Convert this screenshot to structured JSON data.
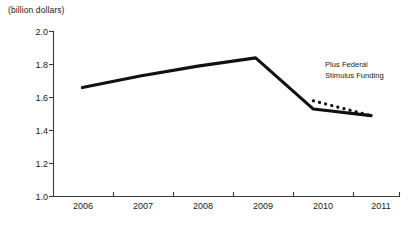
{
  "chart_data": {
    "type": "line",
    "title": "",
    "subtitle": "",
    "unit_label": "(billion dollars)",
    "xlabel": "",
    "ylabel": "",
    "categories": [
      "2006",
      "2007",
      "2008",
      "2009",
      "2010",
      "2011"
    ],
    "x": [
      2006,
      2007,
      2008,
      2009,
      2010,
      2011
    ],
    "xlim": [
      2005.5,
      2011.5
    ],
    "ylim": [
      1.0,
      2.0
    ],
    "yticks": [
      "1.0",
      "1.2",
      "1.4",
      "1.6",
      "1.8",
      "2.0"
    ],
    "ytick_values": [
      1.0,
      1.2,
      1.4,
      1.6,
      1.8,
      2.0
    ],
    "grid": false,
    "legend": "none",
    "series": [
      {
        "name": "Base funding",
        "style": "solid",
        "color": "#111111",
        "x": [
          2006,
          2007,
          2008,
          2009,
          2010,
          2011
        ],
        "values": [
          1.66,
          1.73,
          1.79,
          1.84,
          1.53,
          1.49
        ]
      },
      {
        "name": "Plus Federal Stimulus Funding",
        "style": "dotted",
        "color": "#111111",
        "x": [
          2010,
          2011
        ],
        "values": [
          1.58,
          1.49
        ]
      }
    ],
    "annotations": [
      {
        "name": "stimulus-annotation",
        "line1": "Plus Federal",
        "line2": "Stimulus Funding",
        "x": 2010.1,
        "y": 1.79
      }
    ]
  }
}
